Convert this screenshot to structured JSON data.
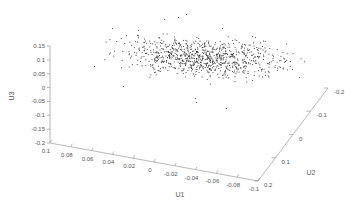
{
  "chart_data": {
    "type": "scatter",
    "dimensions": 3,
    "title": "",
    "xlabel": "U1",
    "ylabel": "U2",
    "zlabel": "U3",
    "x_ticks": [
      "0.1",
      "0.08",
      "0.06",
      "0.04",
      "0.02",
      "0",
      "-0.02",
      "-0.04",
      "-0.06",
      "-0.08",
      "-0.1"
    ],
    "y_ticks": [
      "0.2",
      "0.1",
      "0",
      "-0.1",
      "-0.2"
    ],
    "z_ticks": [
      "0.15",
      "0.1",
      "0.05",
      "0",
      "-0.05",
      "-0.1",
      "-0.15",
      "-0.2"
    ],
    "xlim": [
      -0.1,
      0.1
    ],
    "ylim": [
      -0.2,
      0.2
    ],
    "zlim": [
      -0.2,
      0.15
    ],
    "grid": false,
    "legend": null,
    "point_count_approx": 900,
    "cluster": {
      "description": "Dense flat cloud of small black points concentrated around U3 ≈ 0.05–0.12, spread across full U1 range and U2 range",
      "u3_center": 0.08,
      "u3_spread": 0.04
    },
    "marker_color": "#222222"
  }
}
